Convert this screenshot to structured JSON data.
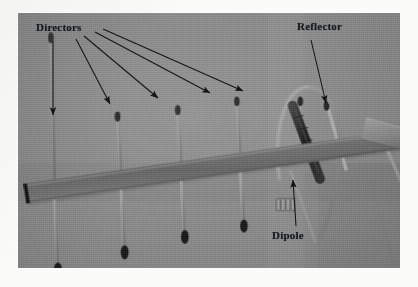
{
  "figure": {
    "media_type": "grayscale photograph",
    "background_color": "#8b8b8b",
    "page_color": "#fbfbf9",
    "annotation_color": "#16191c"
  },
  "annotations": {
    "directors": {
      "label": "Directors",
      "arrow_count": 4,
      "arrow_direction": "down and to the right"
    },
    "reflector": {
      "label": "Reflector",
      "arrow_count": 1,
      "arrow_direction": "down and to the right"
    },
    "dipole": {
      "label": "Dipole",
      "arrow_count": 1,
      "arrow_direction": "up"
    }
  },
  "antenna": {
    "boom_label": "boom",
    "mount_plate_label": "mounting-plate",
    "balun_label": "balun",
    "feed_block_label": "feed-block",
    "director_count": 6,
    "driven_element": "folded dipole loop",
    "reflector_count": 1
  }
}
